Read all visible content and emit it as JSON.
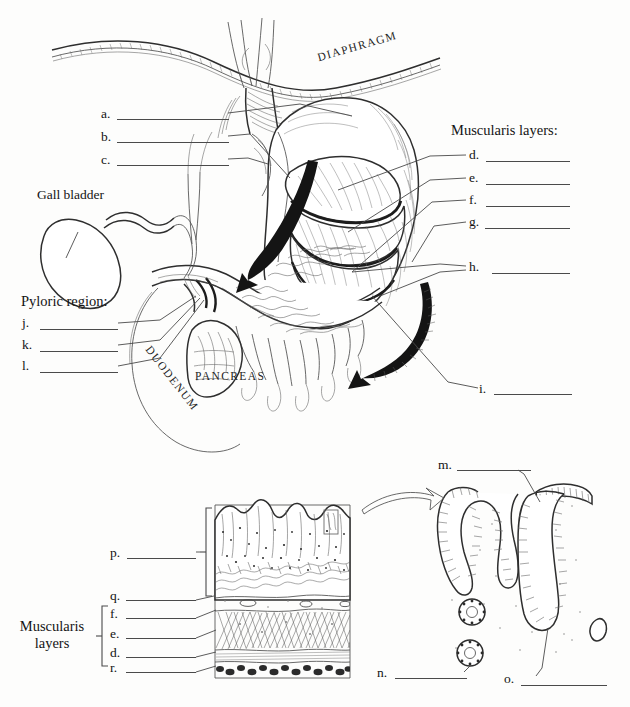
{
  "figure": {
    "title_visible": false,
    "kind": "anatomical-labeling-worksheet",
    "ink_color": "#1a1a1a",
    "paper_color": "#fdfdfc"
  },
  "upper_panel": {
    "organ_captions": [
      {
        "id": "diaphragm",
        "text": "DIAPHRAGM",
        "style": "arched-caps"
      },
      {
        "id": "pancreas",
        "text": "PANCREAS",
        "style": "caps"
      },
      {
        "id": "duodenum",
        "text": "DUODENUM",
        "style": "arched-caps"
      }
    ],
    "named_labels": [
      {
        "id": "gall-bladder",
        "text": "Gall bladder"
      }
    ],
    "left_group": {
      "blanks": [
        {
          "key": "a",
          "text": "a."
        },
        {
          "key": "b",
          "text": "b."
        },
        {
          "key": "c",
          "text": "c."
        }
      ]
    },
    "pyloric_group": {
      "heading": "Pyloric region:",
      "blanks": [
        {
          "key": "j",
          "text": "j."
        },
        {
          "key": "k",
          "text": "k."
        },
        {
          "key": "l",
          "text": "l."
        }
      ]
    },
    "muscularis_group": {
      "heading": "Muscularis layers:",
      "blanks": [
        {
          "key": "d",
          "text": "d."
        },
        {
          "key": "e",
          "text": "e."
        },
        {
          "key": "f",
          "text": "f."
        },
        {
          "key": "g",
          "text": "g."
        }
      ]
    },
    "right_blanks": [
      {
        "key": "h",
        "text": "h."
      },
      {
        "key": "i",
        "text": "i."
      }
    ]
  },
  "lower_left_panel": {
    "blanks_upper": [
      {
        "key": "p",
        "text": "p."
      },
      {
        "key": "q",
        "text": "q."
      }
    ],
    "muscularis_bracket": {
      "label_line1": "Muscularis",
      "label_line2": "layers",
      "blanks": [
        {
          "key": "f",
          "text": "f."
        },
        {
          "key": "e",
          "text": "e."
        },
        {
          "key": "d",
          "text": "d."
        }
      ]
    },
    "blanks_lower": [
      {
        "key": "r",
        "text": "r."
      }
    ]
  },
  "lower_right_panel": {
    "blanks": [
      {
        "key": "m",
        "text": "m."
      },
      {
        "key": "n",
        "text": "n."
      },
      {
        "key": "o",
        "text": "o."
      }
    ],
    "arrow": "magnification-arrow"
  }
}
